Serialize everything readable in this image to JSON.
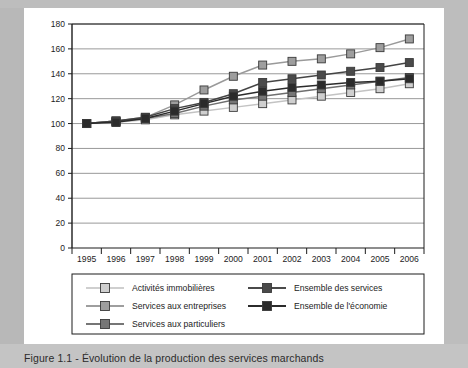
{
  "caption": "Figure 1.1 - Évolution de la production des services marchands",
  "chart_data": {
    "type": "line",
    "title": "",
    "xlabel": "",
    "ylabel": "",
    "categories": [
      "1995",
      "1996",
      "1997",
      "1998",
      "1999",
      "2000",
      "2001",
      "2002",
      "2003",
      "2004",
      "2005",
      "2006"
    ],
    "ylim": [
      0,
      180
    ],
    "ytick_step": 20,
    "yticks": [
      "0",
      "20",
      "40",
      "60",
      "80",
      "100",
      "120",
      "140",
      "160",
      "180"
    ],
    "grid": true,
    "legend_position": "bottom",
    "series": [
      {
        "name": "Activités immobilières",
        "color": "#cfcfcf",
        "line_color": "#c3c3c3",
        "values": [
          100,
          101,
          103,
          107,
          110,
          113,
          116,
          119,
          122,
          125,
          128,
          132
        ]
      },
      {
        "name": "Services aux entreprises",
        "color": "#9e9e9e",
        "line_color": "#9a9a9a",
        "values": [
          100,
          102,
          105,
          115,
          127,
          138,
          147,
          150,
          152,
          156,
          161,
          168
        ]
      },
      {
        "name": "Services aux particuliers",
        "color": "#767676",
        "line_color": "#6f6f6f",
        "values": [
          100,
          102,
          104,
          108,
          114,
          119,
          122,
          125,
          128,
          131,
          134,
          137
        ]
      },
      {
        "name": "Ensemble des services",
        "color": "#4a4a4a",
        "line_color": "#444444",
        "values": [
          100,
          102,
          105,
          112,
          117,
          124,
          133,
          136,
          139,
          142,
          145,
          149
        ]
      },
      {
        "name": "Ensemble de l'économie",
        "color": "#2b2b2b",
        "line_color": "#2b2b2b",
        "values": [
          100,
          101,
          104,
          110,
          116,
          122,
          126,
          129,
          131,
          133,
          134,
          136
        ]
      }
    ],
    "legend_entries": [
      {
        "label": "Activités immobilières",
        "color": "#cfcfcf",
        "column": 0
      },
      {
        "label": "Services aux entreprises",
        "color": "#9e9e9e",
        "column": 0
      },
      {
        "label": "Services aux particuliers",
        "color": "#767676",
        "column": 0
      },
      {
        "label": "Ensemble des services",
        "color": "#4a4a4a",
        "column": 1
      },
      {
        "label": "Ensemble de l'économie",
        "color": "#2b2b2b",
        "column": 1
      }
    ]
  }
}
